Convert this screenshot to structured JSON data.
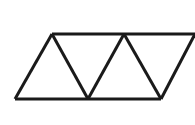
{
  "figure": {
    "background_color": "#ffffff",
    "stroke_color": "#1a1a1a",
    "stroke_width": 3,
    "canvas": {
      "width": 195,
      "height": 125
    },
    "vertices": {
      "bottom_left": {
        "x": 15,
        "y": 99
      },
      "apex_one": {
        "x": 52,
        "y": 34
      },
      "valley_one": {
        "x": 88,
        "y": 99
      },
      "apex_two": {
        "x": 124,
        "y": 34
      },
      "valley_two": {
        "x": 161,
        "y": 99
      },
      "top_right_edge": {
        "x": 195,
        "y": 34
      }
    },
    "segments": [
      {
        "name": "top-horizontal-edge",
        "x1": 52,
        "y1": 34,
        "x2": 195,
        "y2": 34
      },
      {
        "name": "bottom-horizontal-edge",
        "x1": 15,
        "y1": 99,
        "x2": 161,
        "y2": 99
      },
      {
        "name": "diagonal-rising-one",
        "x1": 15,
        "y1": 99,
        "x2": 52,
        "y2": 34
      },
      {
        "name": "diagonal-falling-one",
        "x1": 52,
        "y1": 34,
        "x2": 88,
        "y2": 99
      },
      {
        "name": "diagonal-rising-two",
        "x1": 88,
        "y1": 99,
        "x2": 124,
        "y2": 34
      },
      {
        "name": "diagonal-falling-two",
        "x1": 124,
        "y1": 34,
        "x2": 161,
        "y2": 99
      },
      {
        "name": "diagonal-rising-three",
        "x1": 161,
        "y1": 99,
        "x2": 195,
        "y2": 34
      }
    ],
    "triangle_count": 5,
    "labels": []
  }
}
